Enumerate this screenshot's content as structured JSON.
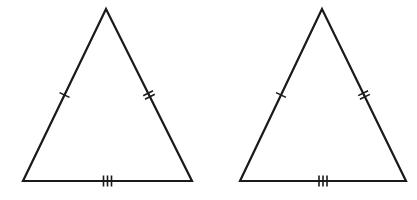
{
  "diagram": {
    "stroke_color": "#1a1a1a",
    "background": "#ffffff",
    "triangles": [
      {
        "id": "triangle-left",
        "vertices": {
          "apex": [
            106,
            9
          ],
          "bottom_left": [
            23,
            181
          ],
          "bottom_right": [
            192,
            181
          ]
        },
        "marks": {
          "left_side": 1,
          "right_side": 2,
          "base": 3
        }
      },
      {
        "id": "triangle-right",
        "vertices": {
          "apex": [
            322,
            9
          ],
          "bottom_left": [
            240,
            181
          ],
          "bottom_right": [
            406,
            181
          ]
        },
        "marks": {
          "left_side": 1,
          "right_side": 2,
          "base": 3
        }
      }
    ]
  }
}
